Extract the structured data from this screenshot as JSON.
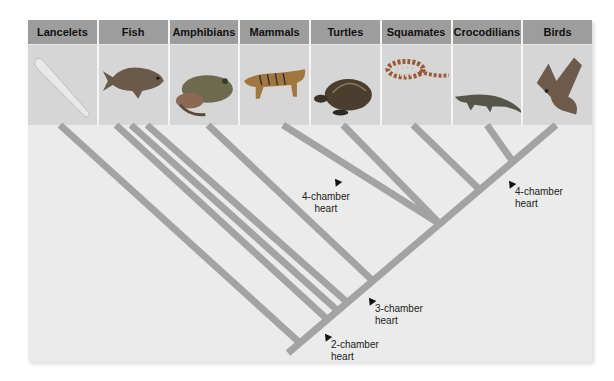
{
  "diagram": {
    "type": "cladogram",
    "taxa": [
      {
        "label": "Lancelets",
        "icon": "lancelet-image"
      },
      {
        "label": "Fish",
        "icon": "fish-image"
      },
      {
        "label": "Amphibians",
        "icon": "frog-image"
      },
      {
        "label": "Mammals",
        "icon": "tiger-image"
      },
      {
        "label": "Turtles",
        "icon": "turtle-image"
      },
      {
        "label": "Squamates",
        "icon": "snake-image"
      },
      {
        "label": "Crocodilians",
        "icon": "crocodile-image"
      },
      {
        "label": "Birds",
        "icon": "bird-image"
      }
    ],
    "annotations": [
      {
        "line1": "2-chamber",
        "line2": "heart"
      },
      {
        "line1": "3-chamber",
        "line2": "heart"
      },
      {
        "line1": "4-chamber",
        "line2": "heart"
      },
      {
        "line1": "4-chamber",
        "line2": "heart"
      }
    ],
    "colors": {
      "branch": "#a3a3a3",
      "header_bg": "#9d9d9d",
      "image_bg": "#d6d6d6",
      "panel_bg": "#ebebeb"
    }
  }
}
